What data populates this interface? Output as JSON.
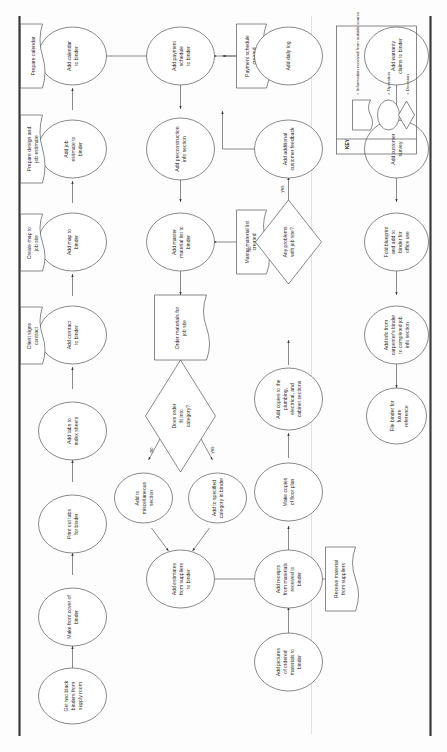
{
  "document": {
    "title": "Job Binder Process Flowchart",
    "orientation": "rotated-90-ccw"
  },
  "key": {
    "title": "KEY",
    "entries": [
      {
        "shape": "flag",
        "label": "= Information received from outside source"
      },
      {
        "shape": "ellipse",
        "label": "= Operation"
      },
      {
        "shape": "diamond",
        "label": "= Decision"
      }
    ]
  },
  "edge_labels": {
    "no": "no",
    "yes": "yes"
  },
  "colors": {
    "shape_stroke": "#4a4a4a",
    "connector": "#3c3c3c",
    "text": "#2b2b2b",
    "frame": "#3a3a3a",
    "background": "#fdfdfd"
  },
  "rows": [
    {
      "id": "row1",
      "nodes": [
        {
          "id": "n1",
          "shape": "ellipse",
          "lines": [
            "Get two black",
            "binders from",
            "supply room"
          ]
        },
        {
          "id": "n2",
          "shape": "ellipse",
          "lines": [
            "Make front cover of",
            "binder"
          ]
        },
        {
          "id": "n3",
          "shape": "ellipse",
          "lines": [
            "Print out tabs",
            "for binder"
          ]
        },
        {
          "id": "n4",
          "shape": "ellipse",
          "lines": [
            "Add tabs to",
            "index sheets"
          ]
        },
        {
          "id": "n5",
          "shape": "ellipse",
          "lines": [
            "Add contract",
            "to binder"
          ]
        },
        {
          "id": "n6",
          "shape": "ellipse",
          "lines": [
            "Add map to",
            "binder"
          ]
        },
        {
          "id": "n7",
          "shape": "ellipse",
          "lines": [
            "Add job",
            "estimate to",
            "binder"
          ]
        },
        {
          "id": "n8",
          "shape": "ellipse",
          "lines": [
            "Add calendar",
            "to binder"
          ]
        }
      ],
      "inputs": [
        {
          "id": "i1",
          "shape": "flag",
          "lines": [
            "Client signs",
            "contract"
          ]
        },
        {
          "id": "i2",
          "shape": "flag",
          "lines": [
            "Create map to",
            "job site"
          ]
        },
        {
          "id": "i3",
          "shape": "flag",
          "lines": [
            "Prepare design and",
            "job estimate"
          ]
        },
        {
          "id": "i4",
          "shape": "flag",
          "lines": [
            "Prepare calendar"
          ]
        }
      ]
    },
    {
      "id": "row2",
      "nodes": [
        {
          "id": "n9",
          "shape": "ellipse",
          "lines": [
            "Add estimates",
            "from suppliers",
            "to binder"
          ]
        },
        {
          "id": "n10",
          "shape": "ellipse",
          "lines": [
            "Add to",
            "miscellaneous",
            "section"
          ]
        },
        {
          "id": "n11",
          "shape": "ellipse",
          "lines": [
            "Add to specified",
            "category in binder"
          ]
        },
        {
          "id": "n12",
          "shape": "diamond",
          "lines": [
            "Does order",
            "fit into",
            "category?"
          ]
        },
        {
          "id": "n13",
          "shape": "flag",
          "lines": [
            "Order materials for",
            "job site"
          ]
        },
        {
          "id": "n14",
          "shape": "ellipse",
          "lines": [
            "Add master",
            "material list to",
            "binder"
          ]
        },
        {
          "id": "n15",
          "shape": "ellipse",
          "lines": [
            "Add preconstruction",
            "info section"
          ]
        },
        {
          "id": "n16",
          "shape": "ellipse",
          "lines": [
            "Add payment",
            "schedule",
            "to binder"
          ]
        }
      ],
      "inputs": [
        {
          "id": "i5",
          "shape": "flag",
          "lines": [
            "Master material list",
            "created"
          ]
        },
        {
          "id": "i6",
          "shape": "flag",
          "lines": [
            "Payment schedule",
            "created"
          ]
        }
      ]
    },
    {
      "id": "row3",
      "nodes": [
        {
          "id": "n17",
          "shape": "ellipse",
          "lines": [
            "Add pictures",
            "of ordered",
            "materials to",
            "binder"
          ]
        },
        {
          "id": "n18",
          "shape": "ellipse",
          "lines": [
            "Add receipts",
            "from materials",
            "received to",
            "binder"
          ]
        },
        {
          "id": "n19",
          "shape": "ellipse",
          "lines": [
            "Make copies",
            "of floor plan"
          ]
        },
        {
          "id": "n20",
          "shape": "ellipse",
          "lines": [
            "Add copies to the",
            "plumbing,",
            "electrical, and",
            "cabinet sections"
          ]
        },
        {
          "id": "n21",
          "shape": "diamond",
          "lines": [
            "Any problems",
            "with job site?"
          ]
        },
        {
          "id": "n22",
          "shape": "ellipse",
          "lines": [
            "Add additional",
            "customer feedback"
          ]
        },
        {
          "id": "n23",
          "shape": "ellipse",
          "lines": [
            "Add daily log"
          ]
        },
        {
          "id": "n24",
          "shape": "ellipse",
          "lines": [
            "Add copies of",
            "payment methods"
          ]
        }
      ],
      "inputs": [
        {
          "id": "i7",
          "shape": "flag",
          "lines": [
            "Receive material",
            "from suppliers"
          ]
        }
      ]
    },
    {
      "id": "row4",
      "nodes": [
        {
          "id": "n25",
          "shape": "ellipse",
          "lines": [
            "File binder for",
            "future",
            "reference"
          ]
        },
        {
          "id": "n26",
          "shape": "ellipse",
          "lines": [
            "Add info from",
            "carpenter's binder",
            "to completed job",
            "info section"
          ]
        },
        {
          "id": "n27",
          "shape": "ellipse",
          "lines": [
            "Fold blueprint",
            "and add to",
            "binder for",
            "office use"
          ]
        },
        {
          "id": "n28",
          "shape": "ellipse",
          "lines": [
            "Add customer",
            "survey"
          ]
        },
        {
          "id": "n29",
          "shape": "ellipse",
          "lines": [
            "Add warranty",
            "claims to binder"
          ]
        }
      ],
      "inputs": []
    }
  ]
}
